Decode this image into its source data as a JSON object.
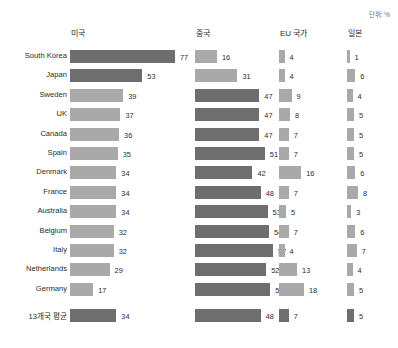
{
  "unit_label": "단위: %",
  "columns": [
    {
      "key": "us",
      "label": "미국",
      "max": 77,
      "scale_px": 105,
      "x": 70
    },
    {
      "key": "cn",
      "label": "중국",
      "max": 57,
      "scale_px": 78,
      "x": 195
    },
    {
      "key": "eu",
      "label": "EU 국가",
      "max": 18,
      "scale_px": 25,
      "x": 279
    },
    {
      "key": "jp",
      "label": "일본",
      "max": 8,
      "scale_px": 11,
      "x": 347
    }
  ],
  "rows": [
    {
      "country": "South Korea",
      "us": 77,
      "cn": 16,
      "eu": 4,
      "jp": 1,
      "us_tone": "dark",
      "cn_tone": "light",
      "eu_tone": "light",
      "jp_tone": "light"
    },
    {
      "country": "Japan",
      "us": 53,
      "cn": 31,
      "eu": 4,
      "jp": 6,
      "us_tone": "dark",
      "cn_tone": "light",
      "eu_tone": "light",
      "jp_tone": "light"
    },
    {
      "country": "Sweden",
      "us": 39,
      "cn": 47,
      "eu": 9,
      "jp": 4,
      "us_tone": "light",
      "cn_tone": "dark",
      "eu_tone": "light",
      "jp_tone": "light"
    },
    {
      "country": "UK",
      "us": 37,
      "cn": 47,
      "eu": 8,
      "jp": 5,
      "us_tone": "light",
      "cn_tone": "dark",
      "eu_tone": "light",
      "jp_tone": "light"
    },
    {
      "country": "Canada",
      "us": 36,
      "cn": 47,
      "eu": 7,
      "jp": 5,
      "us_tone": "light",
      "cn_tone": "dark",
      "eu_tone": "light",
      "jp_tone": "light"
    },
    {
      "country": "Spain",
      "us": 35,
      "cn": 51,
      "eu": 7,
      "jp": 5,
      "us_tone": "light",
      "cn_tone": "dark",
      "eu_tone": "light",
      "jp_tone": "light"
    },
    {
      "country": "Denmark",
      "us": 34,
      "cn": 42,
      "eu": 16,
      "jp": 6,
      "us_tone": "light",
      "cn_tone": "dark",
      "eu_tone": "light",
      "jp_tone": "light"
    },
    {
      "country": "France",
      "us": 34,
      "cn": 48,
      "eu": 7,
      "jp": 8,
      "us_tone": "light",
      "cn_tone": "dark",
      "eu_tone": "light",
      "jp_tone": "light"
    },
    {
      "country": "Australia",
      "us": 34,
      "cn": 53,
      "eu": 5,
      "jp": 3,
      "us_tone": "light",
      "cn_tone": "dark",
      "eu_tone": "light",
      "jp_tone": "light"
    },
    {
      "country": "Belgium",
      "us": 32,
      "cn": 54,
      "eu": 7,
      "jp": 6,
      "us_tone": "light",
      "cn_tone": "dark",
      "eu_tone": "light",
      "jp_tone": "light"
    },
    {
      "country": "Italy",
      "us": 32,
      "cn": 57,
      "eu": 4,
      "jp": 7,
      "us_tone": "light",
      "cn_tone": "dark",
      "eu_tone": "light",
      "jp_tone": "light"
    },
    {
      "country": "Netherlands",
      "us": 29,
      "cn": 52,
      "eu": 13,
      "jp": 4,
      "us_tone": "light",
      "cn_tone": "dark",
      "eu_tone": "light",
      "jp_tone": "light"
    },
    {
      "country": "Germany",
      "us": 17,
      "cn": 55,
      "eu": 18,
      "jp": 5,
      "us_tone": "light",
      "cn_tone": "dark",
      "eu_tone": "light",
      "jp_tone": "light"
    },
    {
      "country": "13개국 평균",
      "us": 34,
      "cn": 48,
      "eu": 7,
      "jp": 5,
      "is_average": true,
      "us_tone": "dark",
      "cn_tone": "dark",
      "eu_tone": "dark",
      "jp_tone": "dark"
    }
  ],
  "chart_data": {
    "type": "bar",
    "title": "",
    "unit": "단위: %",
    "orientation": "horizontal",
    "grid": false,
    "legend": "none",
    "categories": [
      "South Korea",
      "Japan",
      "Sweden",
      "UK",
      "Canada",
      "Spain",
      "Denmark",
      "France",
      "Australia",
      "Belgium",
      "Italy",
      "Netherlands",
      "Germany",
      "13개국 평균"
    ],
    "series": [
      {
        "name": "미국",
        "values": [
          77,
          53,
          39,
          37,
          36,
          35,
          34,
          34,
          34,
          32,
          32,
          29,
          17,
          34
        ]
      },
      {
        "name": "중국",
        "values": [
          16,
          31,
          47,
          47,
          47,
          51,
          42,
          48,
          53,
          54,
          57,
          52,
          55,
          48
        ]
      },
      {
        "name": "EU 국가",
        "values": [
          4,
          4,
          9,
          8,
          7,
          7,
          16,
          7,
          5,
          7,
          4,
          13,
          18,
          7
        ]
      },
      {
        "name": "일본",
        "values": [
          1,
          6,
          4,
          5,
          5,
          5,
          6,
          8,
          3,
          6,
          7,
          4,
          5,
          5
        ]
      }
    ],
    "xlabel": "",
    "ylabel": "",
    "xlim": [
      0,
      77
    ],
    "colors": {
      "dark": "#6e6e6e",
      "light": "#a9a9a9"
    }
  }
}
